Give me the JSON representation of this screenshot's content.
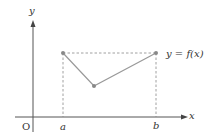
{
  "diagram": {
    "axes": {
      "x_label": "x",
      "y_label": "y",
      "origin_label": "O"
    },
    "ticks": {
      "a_label": "a",
      "b_label": "b"
    },
    "function_label": "y = f(x)",
    "points": {
      "left_endpoint": {
        "x": 63,
        "y": 53
      },
      "minimum": {
        "x": 94,
        "y": 86
      },
      "right_endpoint": {
        "x": 156,
        "y": 53
      }
    },
    "colors": {
      "axis": "#555555",
      "curve": "#999999",
      "dashed": "#888888",
      "point": "#888888",
      "text": "#333333"
    }
  }
}
